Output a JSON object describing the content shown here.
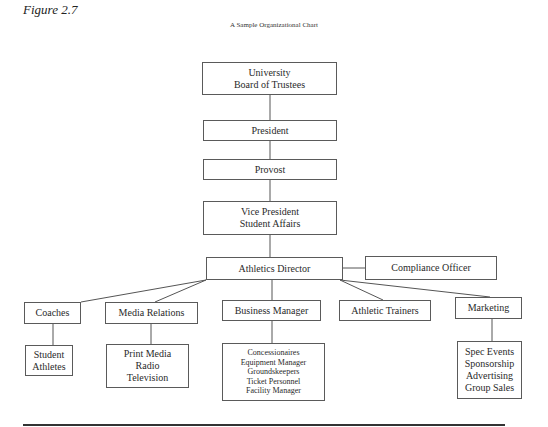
{
  "figure_label": "Figure 2.7",
  "title": "A Sample Organizational Chart",
  "nodes": {
    "trustees": {
      "lines": [
        "University",
        "Board of Trustees"
      ]
    },
    "president": {
      "lines": [
        "President"
      ]
    },
    "provost": {
      "lines": [
        "Provost"
      ]
    },
    "vp": {
      "lines": [
        "Vice President",
        "Student Affairs"
      ]
    },
    "athletics_director": {
      "lines": [
        "Athletics Director"
      ]
    },
    "compliance": {
      "lines": [
        "Compliance Officer"
      ]
    },
    "coaches": {
      "lines": [
        "Coaches"
      ]
    },
    "media_relations": {
      "lines": [
        "Media Relations"
      ]
    },
    "business_manager": {
      "lines": [
        "Business Manager"
      ]
    },
    "athletic_trainers": {
      "lines": [
        "Athletic Trainers"
      ]
    },
    "marketing": {
      "lines": [
        "Marketing"
      ]
    },
    "student_athletes": {
      "lines": [
        "Student",
        "Athletes"
      ]
    },
    "media_outlets": {
      "lines": [
        "Print Media",
        "Radio",
        "Television"
      ]
    },
    "business_staff": {
      "lines": [
        "Concessionaires",
        "Equipment Manager",
        "Groundskeepers",
        "Ticket Personnel",
        "Facility Manager"
      ]
    },
    "marketing_areas": {
      "lines": [
        "Spec Events",
        "Sponsorship",
        "Advertising",
        "Group Sales"
      ]
    }
  },
  "edges": [
    [
      "trustees",
      "president"
    ],
    [
      "president",
      "provost"
    ],
    [
      "provost",
      "vp"
    ],
    [
      "vp",
      "athletics_director"
    ],
    [
      "athletics_director",
      "compliance"
    ],
    [
      "athletics_director",
      "coaches"
    ],
    [
      "athletics_director",
      "media_relations"
    ],
    [
      "athletics_director",
      "business_manager"
    ],
    [
      "athletics_director",
      "athletic_trainers"
    ],
    [
      "athletics_director",
      "marketing"
    ],
    [
      "coaches",
      "student_athletes"
    ],
    [
      "media_relations",
      "media_outlets"
    ],
    [
      "business_manager",
      "business_staff"
    ],
    [
      "marketing",
      "marketing_areas"
    ]
  ]
}
